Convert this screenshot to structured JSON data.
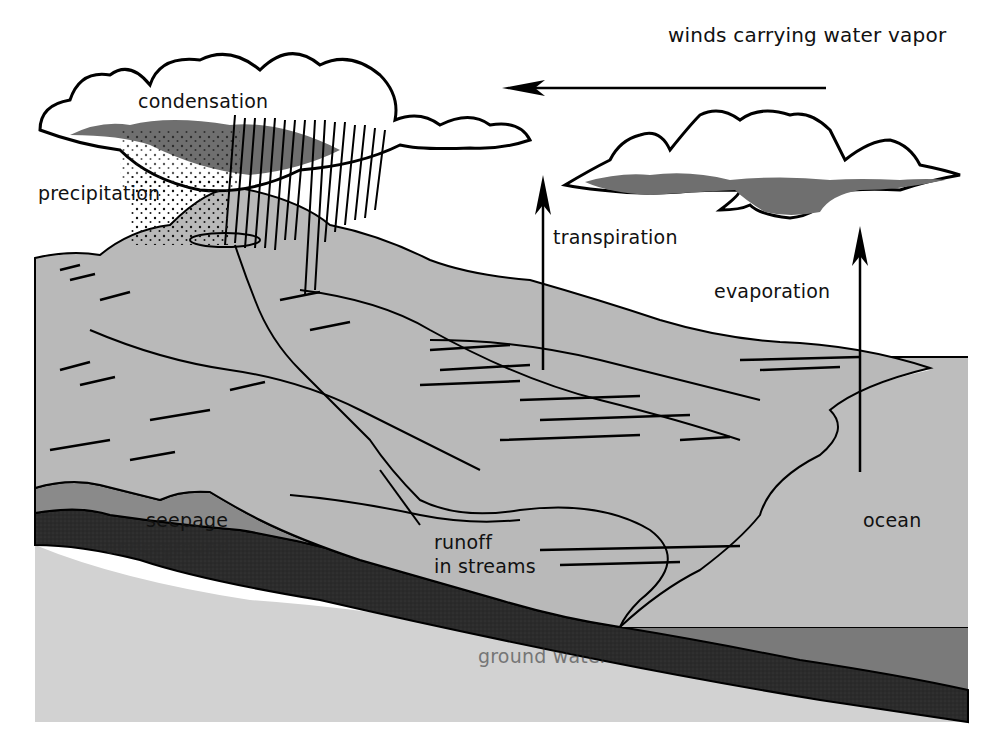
{
  "diagram": {
    "type": "water-cycle",
    "colors": {
      "sky": "#ffffff",
      "land": "#b9b9b9",
      "ocean_surface": "#bdbdbd",
      "seepage_layer": "#8a8a8a",
      "underground_layer": "#2b2b2b",
      "bedrock": "#d2d2d2",
      "ocean_deep": "#7a7a7a",
      "rain_cloud_shade": "#6f6f6f",
      "outline": "#000000"
    },
    "labels": {
      "winds": "winds carrying water vapor",
      "condensation": "condensation",
      "precipitation": "precipitation",
      "transpiration": "transpiration",
      "evaporation": "evaporation",
      "seepage": "seepage",
      "underground": "underground",
      "runoff_line1": "runoff",
      "runoff_line2": "in streams",
      "ocean": "ocean",
      "ground_water": "ground water"
    },
    "arrows": [
      {
        "name": "winds",
        "direction": "left"
      },
      {
        "name": "transpiration",
        "direction": "up"
      },
      {
        "name": "evaporation",
        "direction": "up"
      }
    ]
  }
}
